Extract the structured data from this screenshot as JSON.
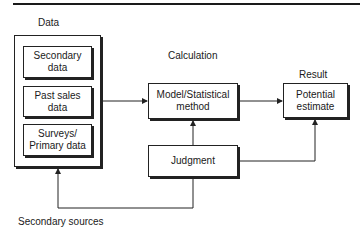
{
  "diagram": {
    "column_headers": {
      "data": "Data",
      "calculation": "Calculation",
      "result": "Result"
    },
    "data_sources": [
      {
        "label": "Secondary data",
        "lines": [
          "Secondary",
          "data"
        ]
      },
      {
        "label": "Past sales data",
        "lines": [
          "Past sales",
          "data"
        ]
      },
      {
        "label": "Surveys/ Primary data",
        "lines": [
          "Surveys/",
          "Primary data"
        ]
      }
    ],
    "model": {
      "lines": [
        "Model/Statistical",
        "method"
      ]
    },
    "result": {
      "lines": [
        "Potential",
        "estimate"
      ]
    },
    "judgment": {
      "label": "Judgment"
    },
    "feedback_label": "Secondary sources",
    "edges": [
      {
        "from": "Data group",
        "to": "Model/Statistical method"
      },
      {
        "from": "Model/Statistical method",
        "to": "Potential estimate"
      },
      {
        "from": "Judgment",
        "to": "Model/Statistical method"
      },
      {
        "from": "Judgment",
        "to": "Potential estimate"
      },
      {
        "from": "Judgment",
        "to": "Data group",
        "label": "Secondary sources"
      }
    ]
  }
}
